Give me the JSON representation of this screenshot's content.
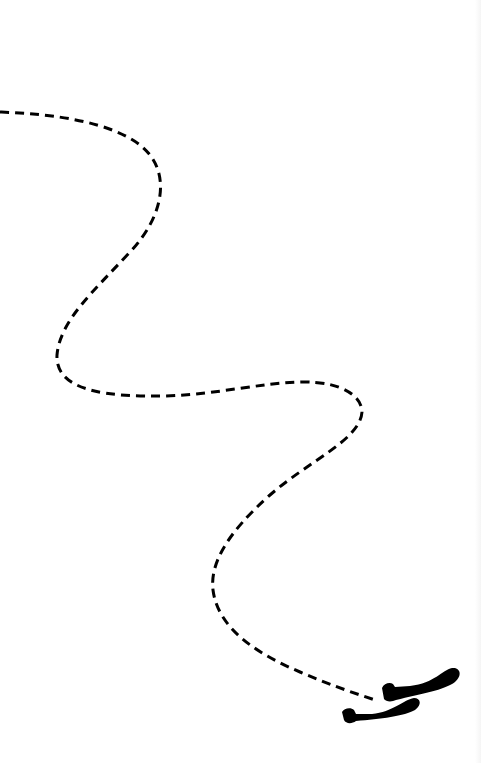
{
  "illustration": {
    "description": "Dashed winding path ending at a pair of shoes",
    "background": "#ffffff",
    "stroke_color": "#000000",
    "path": {
      "style": "dashed",
      "dash": "9 6",
      "stroke_width": 3,
      "waypoints": [
        [
          0,
          112
        ],
        [
          60,
          116
        ],
        [
          130,
          140
        ],
        [
          160,
          195
        ],
        [
          130,
          250
        ],
        [
          75,
          310
        ],
        [
          58,
          360
        ],
        [
          90,
          392
        ],
        [
          160,
          397
        ],
        [
          290,
          383
        ],
        [
          350,
          392
        ],
        [
          355,
          425
        ],
        [
          290,
          470
        ],
        [
          230,
          530
        ],
        [
          212,
          575
        ],
        [
          225,
          620
        ],
        [
          280,
          660
        ],
        [
          375,
          700
        ]
      ]
    },
    "shoes": [
      {
        "label": "right-shoe",
        "x": 380,
        "y": 668
      },
      {
        "label": "left-shoe",
        "x": 342,
        "y": 700
      }
    ]
  }
}
